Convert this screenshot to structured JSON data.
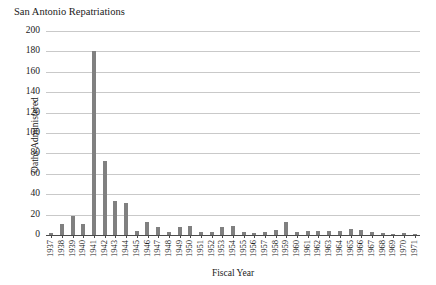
{
  "chart_data": {
    "type": "bar",
    "title": "San Antonio Repatriations",
    "xlabel": "Fiscal Year",
    "ylabel": "Oaths Administered",
    "ylim": [
      0,
      200
    ],
    "ytick_step": 20,
    "yticks": [
      0,
      20,
      40,
      60,
      80,
      100,
      120,
      140,
      160,
      180,
      200
    ],
    "grid": true,
    "legend": "none",
    "bar_color": "#808080",
    "gridline_color": "#c9c9c9",
    "axis_color": "#4a4a4a",
    "categories": [
      "1937",
      "1938",
      "1939",
      "1940",
      "1941",
      "1942",
      "1943",
      "1944",
      "1945",
      "1946",
      "1947",
      "1948",
      "1949",
      "1950",
      "1951",
      "1952",
      "1953",
      "1954",
      "1955",
      "1956",
      "1957",
      "1958",
      "1959",
      "1960",
      "1961",
      "1962",
      "1963",
      "1964",
      "1965",
      "1966",
      "1967",
      "1968",
      "1969",
      "1970",
      "1971"
    ],
    "values": [
      2,
      11,
      19,
      11,
      180,
      73,
      33,
      31,
      4,
      13,
      8,
      3,
      8,
      9,
      3,
      3,
      8,
      9,
      3,
      2,
      3,
      5,
      13,
      3,
      4,
      4,
      4,
      4,
      6,
      5,
      3,
      2,
      1,
      2,
      1
    ]
  }
}
